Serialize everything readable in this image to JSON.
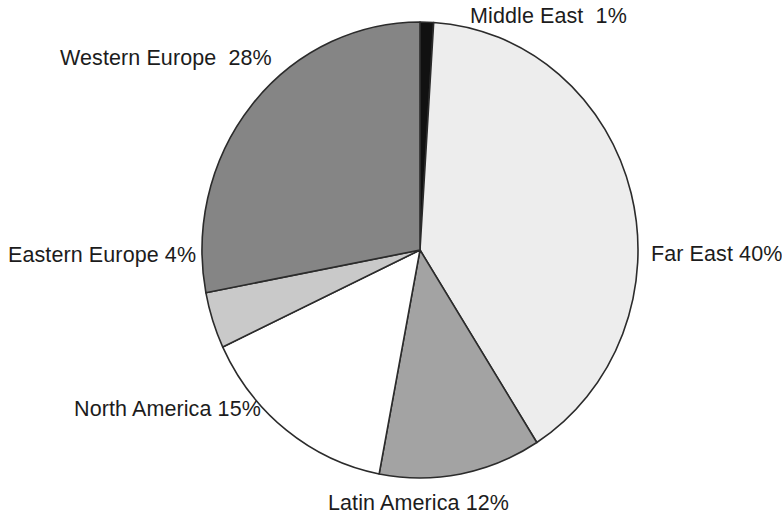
{
  "chart_data": {
    "type": "pie",
    "title": "",
    "subtitle": "",
    "xlabel": "",
    "ylabel": "",
    "legend_position": "none",
    "grid": false,
    "labels_inline": true,
    "unit": "%",
    "total": 100,
    "categories": [
      "Middle East",
      "Far East",
      "Latin America",
      "North America",
      "Eastern Europe",
      "Western Europe"
    ],
    "values": [
      1,
      40,
      12,
      15,
      4,
      28
    ],
    "slices": [
      {
        "name": "Middle East",
        "value": 1,
        "label": "Middle East  1%",
        "color": "#111111",
        "start_angle": 0,
        "end_angle": 3.6
      },
      {
        "name": "Far East",
        "value": 40,
        "label": "Far East 40%",
        "color": "#ededed",
        "start_angle": 3.6,
        "end_angle": 147.6
      },
      {
        "name": "Latin America",
        "value": 12,
        "label": "Latin America 12%",
        "color": "#a3a3a3",
        "start_angle": 147.6,
        "end_angle": 190.8
      },
      {
        "name": "North America",
        "value": 15,
        "label": "North America 15%",
        "color": "#ffffff",
        "start_angle": 190.8,
        "end_angle": 244.8
      },
      {
        "name": "Eastern Europe",
        "value": 4,
        "label": "Eastern Europe 4%",
        "color": "#c9c9c9",
        "start_angle": 244.8,
        "end_angle": 259.2
      },
      {
        "name": "Western Europe",
        "value": 28,
        "label": "Western Europe  28%",
        "color": "#858585",
        "start_angle": 259.2,
        "end_angle": 360
      }
    ],
    "geometry": {
      "center_x": 420,
      "center_y": 250,
      "radius_x": 218,
      "radius_y": 228,
      "stroke_color": "#2b2b2b"
    }
  },
  "labels": {
    "middle_east": "Middle East  1%",
    "western_europe": "Western Europe  28%",
    "eastern_europe": "Eastern Europe 4%",
    "far_east": "Far East 40%",
    "north_america": "North America 15%",
    "latin_america": "Latin America 12%"
  }
}
